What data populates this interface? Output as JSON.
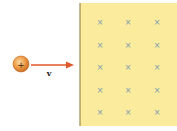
{
  "diagram": {
    "charge": {
      "sign": "+",
      "color": "#e8923a",
      "highlight": "#f7c98a"
    },
    "velocity": {
      "label": "v",
      "arrow_color": "#e2572a"
    },
    "field_region": {
      "fill": "#fbeb9d",
      "border_left": "#9a8a55",
      "symbol": "×",
      "symbol_color": "#7a9ab0",
      "rows": 5,
      "cols": 3
    },
    "colors": {
      "background": "#ffffff"
    }
  }
}
